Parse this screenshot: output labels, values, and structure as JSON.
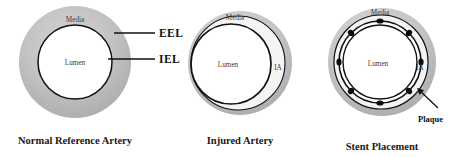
{
  "figure": {
    "background": "#ffffff",
    "colors": {
      "media_fill": "#b9b9b9",
      "media_edge": "#d4d4d4",
      "lumen_fill": "#ffffff",
      "outline": "#111111",
      "plaque_fill": "#f2f2f2",
      "strut": "#0a0a0a",
      "text": "#1a1a1a"
    },
    "panels": [
      {
        "id": "normal",
        "caption": "Normal Reference Artery",
        "labels": {
          "media": "Media",
          "lumen": "Lumen"
        },
        "leaders": [
          {
            "name": "EEL",
            "text": "EEL",
            "target": "external elastic lamina"
          },
          {
            "name": "IEL",
            "text": "IEL",
            "target": "internal elastic lamina"
          }
        ],
        "geometry": {
          "cx": 75,
          "cy": 62,
          "media_rx": 56,
          "media_ry": 56,
          "lumen_rx": 37,
          "lumen_ry": 37
        }
      },
      {
        "id": "injured",
        "caption": "Injured Artery",
        "labels": {
          "media": "Media",
          "lumen": "Lumen",
          "injured_area": "IA"
        },
        "geometry": {
          "cx": 240,
          "cy": 63,
          "media_rx": 52,
          "media_ry": 52,
          "lumen_cx": 231,
          "lumen_cy": 64,
          "lumen_rx": 40,
          "lumen_ry": 40,
          "iel_cx": 238,
          "iel_cy": 63,
          "iel_rx": 47,
          "iel_ry": 47
        }
      },
      {
        "id": "stent",
        "caption": "Stent Placement",
        "labels": {
          "media": "Media",
          "lumen": "Lumen",
          "injured_area": "IA",
          "plaque": "Plaque"
        },
        "strut_count": 8,
        "geometry": {
          "cx": 382,
          "cy": 62,
          "media_rx": 54,
          "media_ry": 54,
          "iel_rx": 47,
          "iel_ry": 47,
          "stent_rx": 41,
          "stent_ry": 41,
          "lumen_rx": 37,
          "lumen_ry": 37
        }
      }
    ]
  }
}
